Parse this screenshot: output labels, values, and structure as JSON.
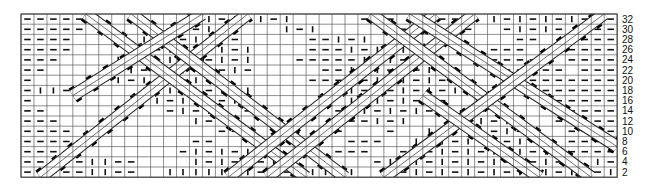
{
  "chart_type": "knitting-cable-chart",
  "grid": {
    "x0": 21,
    "y0": 14,
    "cols": 46,
    "rows": 16,
    "cell_w": 12.96,
    "cell_h": 10.2,
    "line_color": "#444444",
    "symbol_color": "#111111",
    "band_fill": "#ffffff",
    "triangle_fill": "#000000"
  },
  "row_labels": [
    "32",
    "30",
    "28",
    "26",
    "24",
    "22",
    "20",
    "18",
    "16",
    "14",
    "12",
    "10",
    "8",
    "6",
    "4",
    "2"
  ],
  "legend_symbols": {
    "-": "purl",
    "|": "knit",
    ".": "cable/none"
  },
  "cells": [
    "-----.........|-|-|-|.....---...--..|-|-|-|-.-",
    "-----.....--|-|-|...|-|.....--...--..-|-|-.---",
    "----.....|-|-|-|-.....--|-|...........--..----",
    "----....-|-|-|-|-|....---|-|-|-.....---...----",
    "---....|-|-|-|-|-|...-----|-|-|-|...-----.----",
    "--....--|-|-|-|-|-.....--|-|-|-|-|..------.---",
    "-....|-|-|-|-|-|......---|-|-|-|-|-..-.-------",
    "-||-.....|-|-|-|-|......-|-|-|-|-|.....-------",
    "-.........|-|-|-|-.......|-|-|-|-.......------",
    "--.........-|-|-.--.....--|-|-|-..--......----",
    "---..........|-....-.....--|-|...|-|-|...-----",
    "----...........--.......-...-..|-|-|-|-...----",
    "-----........--..........---..|-|-|-|-|-..----",
    "-----.......-|-|-|-.....---..-|-|-|-|-|-|.----",
    "-----||--....|-|-|-|-......-|-|-|-|-|-|-|-..|-",
    "-----||--..|||||-|-|-|||||..|-|-|-|-|-|-|-||-|-"
  ],
  "bands": [
    [
      [
        1.5,
        16
      ],
      [
        17.5,
        0
      ]
    ],
    [
      [
        5,
        0
      ],
      [
        22,
        16
      ]
    ],
    [
      [
        8.5,
        0
      ],
      [
        25,
        16
      ]
    ],
    [
      [
        16,
        16
      ],
      [
        32,
        0
      ]
    ],
    [
      [
        19,
        16
      ],
      [
        35,
        0
      ]
    ],
    [
      [
        27,
        0
      ],
      [
        44,
        16
      ]
    ],
    [
      [
        30,
        0
      ],
      [
        46,
        13
      ]
    ],
    [
      [
        28,
        16
      ],
      [
        45,
        0
      ]
    ],
    [
      [
        4,
        8
      ],
      [
        14,
        0
      ]
    ],
    [
      [
        31,
        8
      ],
      [
        40,
        16
      ]
    ]
  ]
}
